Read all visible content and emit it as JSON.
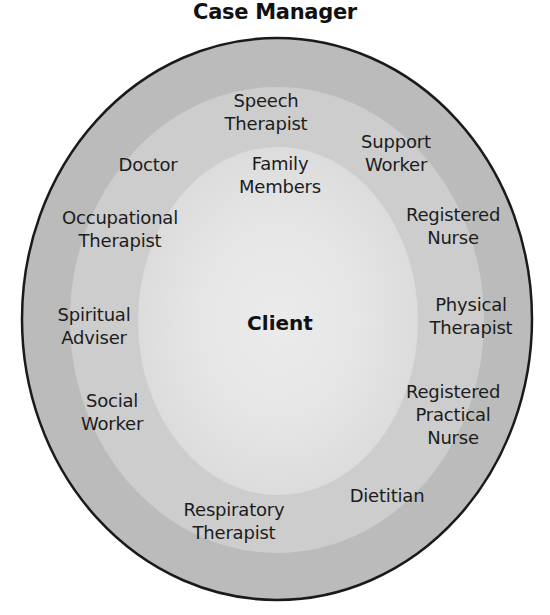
{
  "title": "Case Manager",
  "colors": {
    "outer_ring": "#bbbbbb",
    "middle_ring": "#cdcdcd",
    "inner_region": "#dddddd",
    "inner_core": "#e9e9e9",
    "outline": "#1a1a1a",
    "background": "#ffffff"
  },
  "center": {
    "label": "Client"
  },
  "inner_ring": {
    "labels": [
      {
        "lines": [
          "Family",
          "Members"
        ]
      }
    ]
  },
  "outer_ring": {
    "labels": [
      {
        "lines": [
          "Speech",
          "Therapist"
        ]
      },
      {
        "lines": [
          "Support",
          "Worker"
        ]
      },
      {
        "lines": [
          "Doctor"
        ]
      },
      {
        "lines": [
          "Occupational",
          "Therapist"
        ]
      },
      {
        "lines": [
          "Registered",
          "Nurse"
        ]
      },
      {
        "lines": [
          "Spiritual",
          "Adviser"
        ]
      },
      {
        "lines": [
          "Physical",
          "Therapist"
        ]
      },
      {
        "lines": [
          "Social",
          "Worker"
        ]
      },
      {
        "lines": [
          "Registered",
          "Practical",
          "Nurse"
        ]
      },
      {
        "lines": [
          "Dietitian"
        ]
      },
      {
        "lines": [
          "Respiratory",
          "Therapist"
        ]
      }
    ]
  }
}
